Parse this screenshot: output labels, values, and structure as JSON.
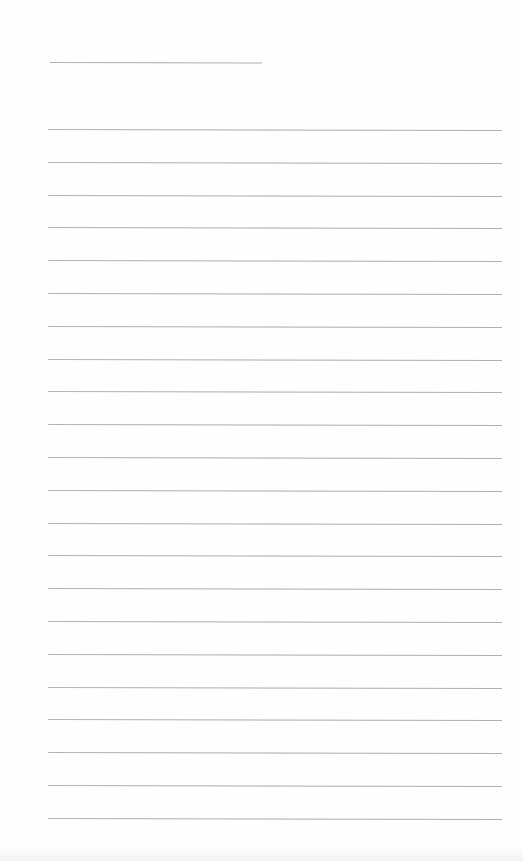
{
  "document": {
    "type": "lined-paper",
    "background_color": "#fefefe",
    "rule_color": "#a9a9a9",
    "title_line": {
      "x": 50,
      "y": 62,
      "width": 212
    },
    "ruled_lines": {
      "count": 22,
      "start_y": 129,
      "spacing": 32.8,
      "x": 48,
      "width": 454
    }
  }
}
